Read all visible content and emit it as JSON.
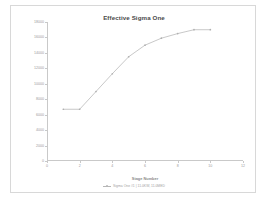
{
  "chart_data": {
    "type": "line",
    "title": "Effective Sigma One",
    "xlabel": "Stage Number",
    "ylabel": "Effective Sigma One [µm]",
    "x": [
      1,
      2,
      3,
      4,
      5,
      6,
      7,
      8,
      9,
      10
    ],
    "values": [
      6700,
      6700,
      9000,
      11300,
      13500,
      15000,
      15900,
      16500,
      17000,
      17000
    ],
    "series": [
      {
        "name": "Sigma One #1 | 11.0KW, 11.0MED",
        "x": [
          1,
          2,
          3,
          4,
          5,
          6,
          7,
          8,
          9,
          10
        ],
        "values": [
          6700,
          6700,
          9000,
          11300,
          13500,
          15000,
          15900,
          16500,
          17000,
          17000
        ]
      }
    ],
    "xlim": [
      0,
      12
    ],
    "ylim": [
      0,
      18000
    ],
    "xticks": [
      "0",
      "2",
      "4",
      "6",
      "8",
      "10",
      "12"
    ],
    "xtick_values": [
      0,
      2,
      4,
      6,
      8,
      10,
      12
    ],
    "yticks": [
      "18000",
      "16000",
      "14000",
      "12000",
      "10000",
      "8000",
      "6000",
      "4000",
      "2000",
      "0"
    ],
    "ytick_values": [
      18000,
      16000,
      14000,
      12000,
      10000,
      8000,
      6000,
      4000,
      2000,
      0
    ],
    "grid": false,
    "legend_position": "bottom",
    "line_color": "#b0b0b0",
    "marker_color": "#b0b0b0",
    "axis_color": "#c9c9c9",
    "title_color": "#4a4a4a",
    "tick_label_color": "#9a9a9a"
  },
  "legend": {
    "entry_label": "Sigma One #1 | 11.0KW, 11.0MED",
    "marker_icon": "line-marker-icon"
  }
}
